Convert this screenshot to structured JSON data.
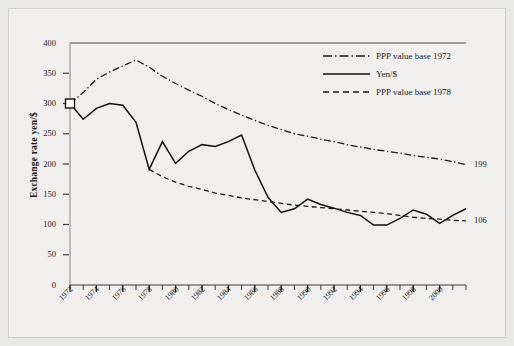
{
  "chart_data": {
    "type": "line",
    "title": "",
    "subtitle": "",
    "xlabel": "",
    "ylabel": "Exchange rate yen/$",
    "xlim": [
      1972,
      2002
    ],
    "ylim": [
      0,
      400
    ],
    "grid": false,
    "legend_position": "top-right",
    "ytick_labels": [
      "0",
      "50",
      "100",
      "150",
      "200",
      "250",
      "300",
      "350",
      "400"
    ],
    "ytick_values": [
      0,
      50,
      100,
      150,
      200,
      250,
      300,
      350,
      400
    ],
    "xtick_labels": [
      "1972",
      "1974",
      "1976",
      "1978",
      "1980",
      "1982",
      "1984",
      "1986",
      "1988",
      "1990",
      "1992",
      "1994",
      "1996",
      "1998",
      "2000"
    ],
    "xtick_values": [
      1972,
      1974,
      1976,
      1978,
      1980,
      1982,
      1984,
      1986,
      1988,
      1990,
      1992,
      1994,
      1996,
      1998,
      2000
    ],
    "minor_xticks_every": 1,
    "x": [
      1972,
      1973,
      1974,
      1975,
      1976,
      1977,
      1978,
      1979,
      1980,
      1981,
      1982,
      1983,
      1984,
      1985,
      1986,
      1987,
      1988,
      1989,
      1990,
      1991,
      1992,
      1993,
      1994,
      1995,
      1996,
      1997,
      1998,
      1999,
      2000,
      2001,
      2002
    ],
    "series": [
      {
        "name": "PPP value base 1972",
        "style": "dash-dot",
        "color": "#1a1a1a",
        "end_label": "199",
        "values": [
          300,
          318,
          340,
          352,
          362,
          372,
          360,
          345,
          333,
          322,
          312,
          300,
          290,
          281,
          272,
          264,
          257,
          250,
          246,
          241,
          237,
          232,
          228,
          224,
          221,
          218,
          214,
          211,
          208,
          204,
          199
        ]
      },
      {
        "name": "Yen/$",
        "style": "solid",
        "color": "#111111",
        "marker_start": "open-square",
        "values": [
          300,
          274,
          292,
          300,
          297,
          269,
          191,
          237,
          201,
          221,
          232,
          229,
          237,
          248,
          190,
          145,
          120,
          126,
          142,
          133,
          127,
          120,
          115,
          99,
          99,
          110,
          124,
          117,
          102,
          115,
          126
        ]
      },
      {
        "name": "PPP value base 1978",
        "style": "dashed",
        "color": "#1a1a1a",
        "end_label": "106",
        "values": [
          null,
          null,
          null,
          null,
          null,
          null,
          191,
          179,
          170,
          163,
          158,
          152,
          148,
          144,
          141,
          138,
          135,
          132,
          130,
          128,
          126,
          124,
          122,
          120,
          118,
          115,
          112,
          110,
          109,
          107,
          106
        ]
      }
    ],
    "annotations": [
      {
        "text": "199",
        "x": 2002,
        "y": 199,
        "placement": "right"
      },
      {
        "text": "106",
        "x": 2002,
        "y": 106,
        "placement": "right"
      }
    ]
  },
  "legend": {
    "items": [
      {
        "label": "PPP value base 1972"
      },
      {
        "label": "Yen/$"
      },
      {
        "label": "PPP value base 1978"
      }
    ]
  }
}
